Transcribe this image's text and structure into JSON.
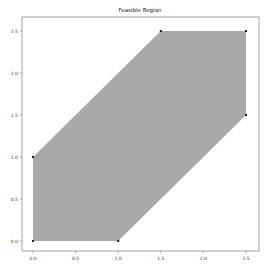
{
  "chart_data": {
    "type": "area",
    "title": "Feasible Region",
    "xlabel": "",
    "ylabel": "",
    "xlim": [
      -0.1,
      2.6
    ],
    "ylim": [
      -0.1,
      2.6
    ],
    "x_ticks": [
      "0.0",
      "0.5",
      "1.0",
      "1.5",
      "2.0",
      "2.5"
    ],
    "y_ticks": [
      "0.0",
      "0.5",
      "1.0",
      "1.5",
      "2.0",
      "2.5"
    ],
    "grid": false,
    "legend": null,
    "polygon": {
      "fill_color": "#a9a9a9",
      "vertices": [
        {
          "x": 0.0,
          "y": 0.0
        },
        {
          "x": 1.0,
          "y": 0.0
        },
        {
          "x": 2.5,
          "y": 1.5
        },
        {
          "x": 2.5,
          "y": 2.5
        },
        {
          "x": 1.5,
          "y": 2.5
        },
        {
          "x": 0.0,
          "y": 1.0
        }
      ]
    },
    "marker_color": "#222222"
  }
}
